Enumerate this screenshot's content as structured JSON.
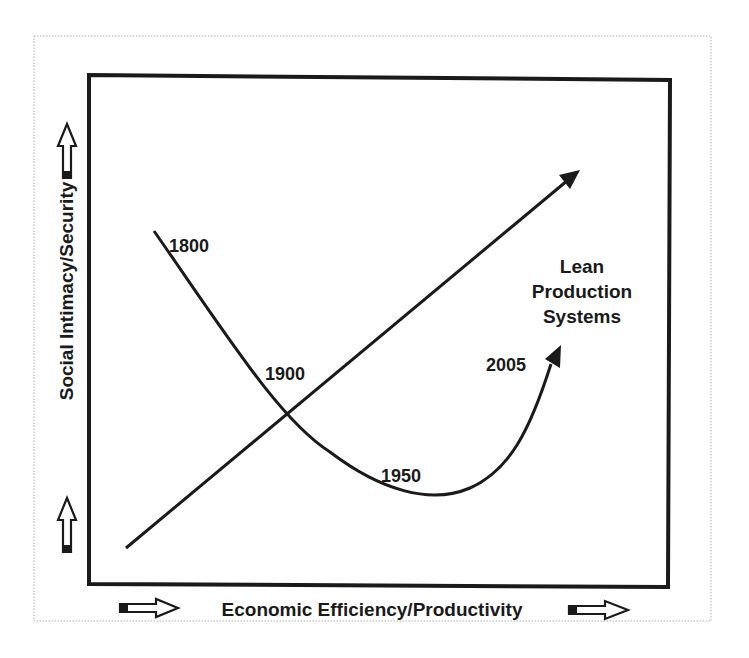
{
  "diagram": {
    "x_axis_label": "Economic Efficiency/Productivity",
    "y_axis_label": "Social Intimacy/Security",
    "curve_labels": {
      "y1800": "1800",
      "y1900": "1900",
      "y1950": "1950",
      "y2005": "2005"
    },
    "arrow_label": {
      "line1": "Lean",
      "line2": "Production",
      "line3": "Systems"
    },
    "colors": {
      "ink": "#1a1a1a",
      "frame_dotted": "#b0b0b0",
      "background": "#ffffff"
    }
  }
}
